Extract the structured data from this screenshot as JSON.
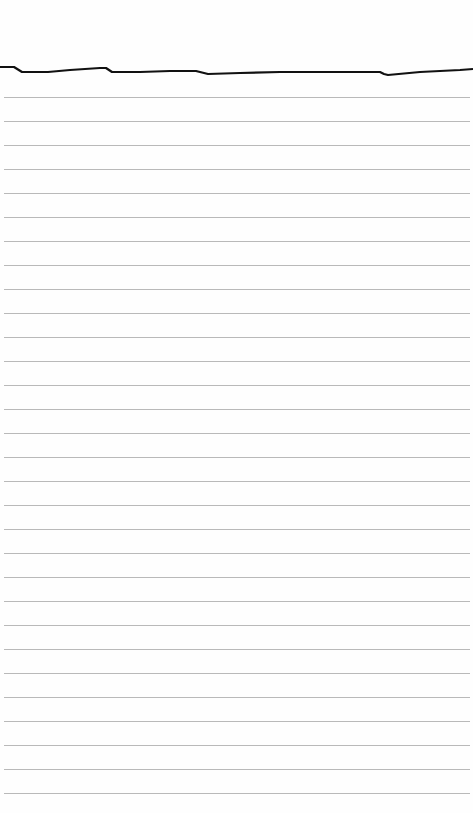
{
  "image": {
    "subject": "sheet of lined notebook paper with torn top edge",
    "background_color": "#fefefe",
    "rule_color": "#b9b9b9",
    "edge_color": "#111111",
    "rules": {
      "count": 30,
      "first_y": 97,
      "spacing": 24
    },
    "top_edge_path": "M0,67 L14,67 L22,72 L48,72 L70,70 L100,68 L106,68 L112,72 L140,72 L170,71 L196,71 L208,74 L240,73 L280,72 L320,72 L380,72 L384,74 L388,75 L420,72 L460,70 L473,69"
  }
}
